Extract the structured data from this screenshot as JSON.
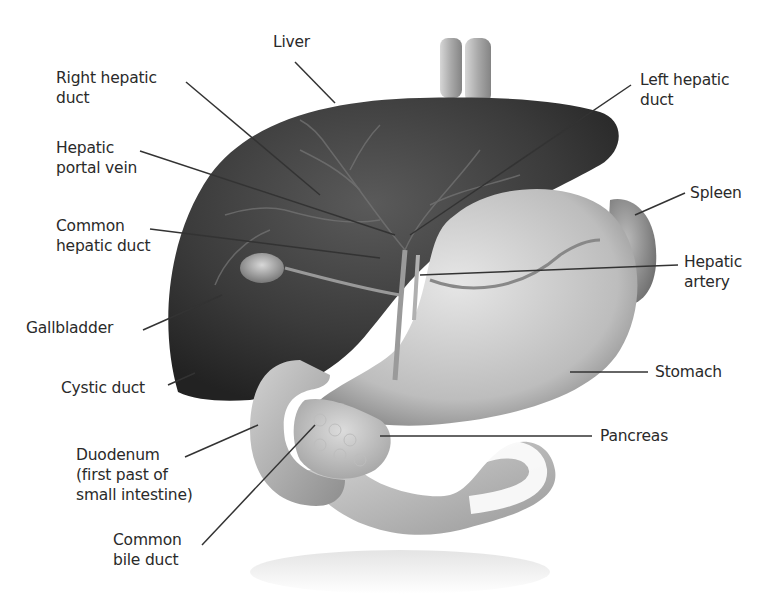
{
  "diagram": {
    "type": "anatomical-illustration",
    "labels": {
      "liver": "Liver",
      "right_hepatic_duct": "Right hepatic\nduct",
      "left_hepatic_duct": "Left hepatic\nduct",
      "hepatic_portal_vein": "Hepatic\nportal vein",
      "common_hepatic_duct": "Common\nhepatic duct",
      "spleen": "Spleen",
      "hepatic_artery": "Hepatic\nartery",
      "gallbladder": "Gallbladder",
      "cystic_duct": "Cystic duct",
      "stomach": "Stomach",
      "pancreas": "Pancreas",
      "duodenum": "Duodenum\n(first past of\nsmall intestine)",
      "common_bile_duct": "Common\nbile duct"
    },
    "colors": {
      "liver": "#3a3a3a",
      "stomach": "#c8c8c8",
      "intestine": "#b5b5b5",
      "leader_line": "#333333",
      "text": "#2a2a2a"
    }
  }
}
